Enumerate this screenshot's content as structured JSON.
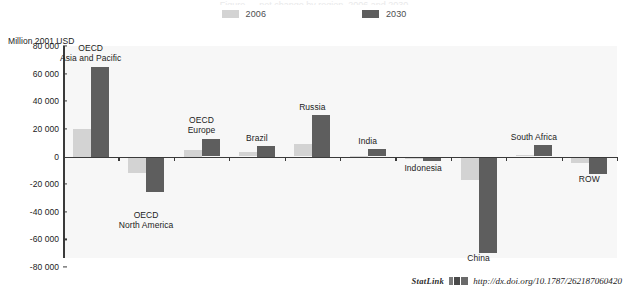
{
  "title_partial": "Figure — net change by region, 2006 and 2030",
  "legend": {
    "position": "top-center",
    "items": [
      {
        "label": "2006",
        "color": "#d3d3d3",
        "name": "legend-swatch-2006"
      },
      {
        "label": "2030",
        "color": "#5e5e5e",
        "name": "legend-swatch-2030"
      }
    ]
  },
  "axis": {
    "unit_caption": "Million 2001 USD",
    "ticks": [
      "80 000",
      "60 000",
      "40 000",
      "20 000",
      "0",
      "-20 000",
      "-40 000",
      "-60 000",
      "-80 000"
    ],
    "tick_values": [
      80000,
      60000,
      40000,
      20000,
      0,
      -20000,
      -40000,
      -60000,
      -80000
    ]
  },
  "footer": {
    "statlink_label": "StatLink",
    "glyph": "statlink-barcode-icon",
    "url": "http://dx.doi.org/10.1787/262187060420"
  },
  "chart_data": {
    "type": "bar",
    "title": "Million 2001 USD",
    "xlabel": "",
    "ylabel": "Million 2001 USD",
    "ylim": [
      -80000,
      80000
    ],
    "grid": false,
    "legend_position": "top-center",
    "categories": [
      "OECD Asia and Pacific",
      "OECD North America",
      "OECD Europe",
      "Brazil",
      "Russia",
      "India",
      "Indonesia",
      "China",
      "South Africa",
      "ROW"
    ],
    "category_label_lines": [
      [
        "OECD",
        "Asia and Pacific"
      ],
      [
        "OECD",
        "North America"
      ],
      [
        "OECD",
        "Europe"
      ],
      [
        "Brazil"
      ],
      [
        "Russia"
      ],
      [
        "India"
      ],
      [
        "Indonesia"
      ],
      [
        "China"
      ],
      [
        "South Africa"
      ],
      [
        "ROW"
      ]
    ],
    "series": [
      {
        "name": "2006",
        "color": "#d3d3d3",
        "values": [
          20000,
          -12000,
          5000,
          3000,
          9000,
          500,
          -1500,
          -17000,
          1000,
          -4500
        ]
      },
      {
        "name": "2030",
        "color": "#5e5e5e",
        "values": [
          65000,
          -26000,
          13000,
          7500,
          30000,
          5500,
          -3000,
          -70000,
          8000,
          -13000
        ]
      }
    ]
  }
}
